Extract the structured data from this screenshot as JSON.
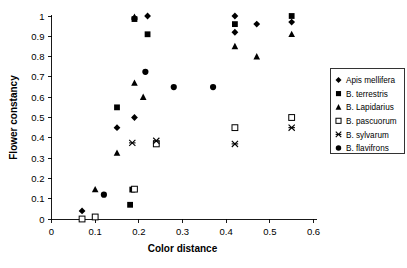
{
  "chart_data": {
    "type": "scatter",
    "title": "",
    "xlabel": "Color distance",
    "ylabel": "Flower constancy",
    "xlim": [
      0,
      0.6
    ],
    "ylim": [
      0,
      1
    ],
    "xticks": [
      "0",
      "0.1",
      "0.2",
      "0.3",
      "0.4",
      "0.5",
      "0.6"
    ],
    "xtick_values": [
      0,
      0.1,
      0.2,
      0.3,
      0.4,
      0.5,
      0.6
    ],
    "yticks": [
      "0",
      "0.1",
      "0.2",
      "0.3",
      "0.4",
      "0.5",
      "0.6",
      "0.7",
      "0.8",
      "0.9",
      "1"
    ],
    "ytick_values": [
      0,
      0.1,
      0.2,
      0.3,
      0.4,
      0.5,
      0.6,
      0.7,
      0.8,
      0.9,
      1
    ],
    "grid": false,
    "legend_position": "right",
    "marker_color": "#000000",
    "series": [
      {
        "name": "Apis mellifera",
        "marker": "diamond-filled",
        "points": [
          {
            "x": 0.07,
            "y": 0.04
          },
          {
            "x": 0.15,
            "y": 0.45
          },
          {
            "x": 0.19,
            "y": 0.5
          },
          {
            "x": 0.19,
            "y": 0.99
          },
          {
            "x": 0.22,
            "y": 1.0
          },
          {
            "x": 0.42,
            "y": 1.0
          },
          {
            "x": 0.42,
            "y": 0.92
          },
          {
            "x": 0.47,
            "y": 0.96
          },
          {
            "x": 0.55,
            "y": 0.97
          }
        ]
      },
      {
        "name": "B. terrestris",
        "marker": "square-filled",
        "points": [
          {
            "x": 0.1,
            "y": 0.01
          },
          {
            "x": 0.15,
            "y": 0.55
          },
          {
            "x": 0.18,
            "y": 0.07
          },
          {
            "x": 0.185,
            "y": 0.145
          },
          {
            "x": 0.19,
            "y": 0.985
          },
          {
            "x": 0.22,
            "y": 0.91
          },
          {
            "x": 0.42,
            "y": 0.96
          },
          {
            "x": 0.55,
            "y": 1.0
          }
        ]
      },
      {
        "name": "B. Lapidarius",
        "marker": "triangle-filled",
        "points": [
          {
            "x": 0.1,
            "y": 0.145
          },
          {
            "x": 0.15,
            "y": 0.325
          },
          {
            "x": 0.19,
            "y": 0.67
          },
          {
            "x": 0.19,
            "y": 0.995
          },
          {
            "x": 0.21,
            "y": 0.6
          },
          {
            "x": 0.42,
            "y": 0.85
          },
          {
            "x": 0.47,
            "y": 0.8
          },
          {
            "x": 0.55,
            "y": 0.91
          }
        ]
      },
      {
        "name": "B. pascuorum",
        "marker": "square-open",
        "points": [
          {
            "x": 0.07,
            "y": 0.0
          },
          {
            "x": 0.1,
            "y": 0.01
          },
          {
            "x": 0.19,
            "y": 0.147
          },
          {
            "x": 0.24,
            "y": 0.37
          },
          {
            "x": 0.42,
            "y": 0.45
          },
          {
            "x": 0.55,
            "y": 0.5
          }
        ]
      },
      {
        "name": "B. sylvarum",
        "marker": "cross",
        "points": [
          {
            "x": 0.185,
            "y": 0.375
          },
          {
            "x": 0.24,
            "y": 0.385
          },
          {
            "x": 0.42,
            "y": 0.37
          },
          {
            "x": 0.55,
            "y": 0.45
          }
        ]
      },
      {
        "name": "B. flavifrons",
        "marker": "circle-filled",
        "points": [
          {
            "x": 0.12,
            "y": 0.12
          },
          {
            "x": 0.215,
            "y": 0.725
          },
          {
            "x": 0.28,
            "y": 0.65
          },
          {
            "x": 0.37,
            "y": 0.65
          }
        ]
      }
    ]
  }
}
